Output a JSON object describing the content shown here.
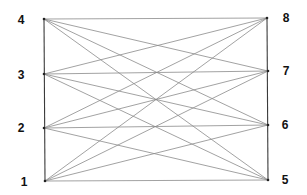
{
  "diagram": {
    "type": "complete-bipartite-graph",
    "title": "",
    "left_partition": [
      "1",
      "2",
      "3",
      "4"
    ],
    "right_partition": [
      "5",
      "6",
      "7",
      "8"
    ],
    "nodes": [
      {
        "id": "1",
        "label": "1",
        "x": 45,
        "y": 181,
        "label_x": 24,
        "label_y": 182
      },
      {
        "id": "2",
        "label": "2",
        "x": 44,
        "y": 128,
        "label_x": 21,
        "label_y": 128
      },
      {
        "id": "3",
        "label": "3",
        "x": 44,
        "y": 74,
        "label_x": 21,
        "label_y": 75
      },
      {
        "id": "4",
        "label": "4",
        "x": 44,
        "y": 19,
        "label_x": 21,
        "label_y": 20
      },
      {
        "id": "5",
        "label": "5",
        "x": 268,
        "y": 180,
        "label_x": 285,
        "label_y": 180
      },
      {
        "id": "6",
        "label": "6",
        "x": 268,
        "y": 125,
        "label_x": 285,
        "label_y": 125
      },
      {
        "id": "7",
        "label": "7",
        "x": 268,
        "y": 71,
        "label_x": 286,
        "label_y": 71
      },
      {
        "id": "8",
        "label": "8",
        "x": 267,
        "y": 18,
        "label_x": 286,
        "label_y": 18
      }
    ],
    "edges": [
      [
        "1",
        "5"
      ],
      [
        "1",
        "6"
      ],
      [
        "1",
        "7"
      ],
      [
        "1",
        "8"
      ],
      [
        "2",
        "5"
      ],
      [
        "2",
        "6"
      ],
      [
        "2",
        "7"
      ],
      [
        "2",
        "8"
      ],
      [
        "3",
        "5"
      ],
      [
        "3",
        "6"
      ],
      [
        "3",
        "7"
      ],
      [
        "3",
        "8"
      ],
      [
        "4",
        "5"
      ],
      [
        "4",
        "6"
      ],
      [
        "4",
        "7"
      ],
      [
        "4",
        "8"
      ]
    ],
    "frame_edges": [
      [
        "1",
        "4"
      ],
      [
        "5",
        "8"
      ]
    ],
    "colors": {
      "background": "#ffffff",
      "edge": "#8a8a8a",
      "frame_edge": "#3a3a3a",
      "node": "#222222",
      "label": "#111111"
    }
  }
}
